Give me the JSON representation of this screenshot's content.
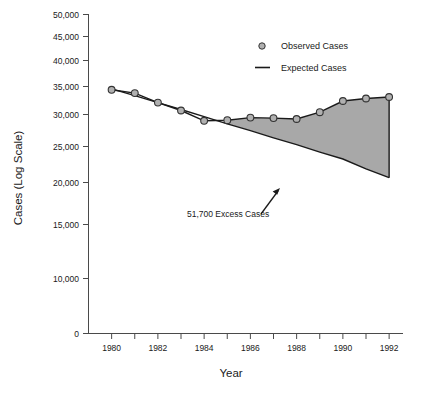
{
  "chart_data": {
    "type": "line",
    "title": "",
    "xlabel": "Year",
    "ylabel": "Cases (Log Scale)",
    "yscale": "log",
    "grid": false,
    "legend_position": "top-center-right",
    "xlim": [
      1979,
      1992.6
    ],
    "ylim": [
      8500,
      50000
    ],
    "x": [
      1980,
      1981,
      1982,
      1983,
      1984,
      1985,
      1986,
      1987,
      1988,
      1989,
      1990,
      1991,
      1992
    ],
    "xticks": [
      1980,
      1981,
      1982,
      1983,
      1984,
      1985,
      1986,
      1987,
      1988,
      1989,
      1990,
      1991,
      1992
    ],
    "xtick_labels": [
      "1980",
      "",
      "1982",
      "",
      "1984",
      "",
      "1986",
      "",
      "1988",
      "",
      "1990",
      "",
      "1992"
    ],
    "yticks": [
      0,
      10000,
      15000,
      20000,
      25000,
      30000,
      35000,
      40000,
      45000,
      50000
    ],
    "ytick_labels": [
      "0",
      "10,000",
      "15,000",
      "20,000",
      "25,000",
      "30,000",
      "35,000",
      "40,000",
      "45,000",
      "50,000"
    ],
    "series": [
      {
        "name": "Observed Cases",
        "marker": "circle",
        "values": [
          28000,
          27300,
          25400,
          23900,
          22100,
          22200,
          22650,
          22550,
          22400,
          23600,
          25700,
          26200,
          26500
        ]
      },
      {
        "name": "Expected Cases",
        "marker": "line",
        "values": [
          28200,
          26800,
          25400,
          24100,
          22800,
          21600,
          20500,
          19400,
          18400,
          17400,
          16500,
          15300,
          14300
        ]
      }
    ],
    "shaded_region": {
      "label": "51,700 Excess Cases",
      "x_start": 1985,
      "x_end": 1992,
      "fill_color": "#a8a8a8"
    },
    "annotations": [
      {
        "text": "51,700 Excess Cases",
        "arrow": "up-right-arrow"
      }
    ]
  },
  "legend": {
    "items": [
      {
        "label": "Observed Cases",
        "symbol": "circle-marker"
      },
      {
        "label": "Expected Cases",
        "symbol": "line-marker"
      }
    ]
  },
  "colors": {
    "ink": "#1a1a1a",
    "axis": "#4a4a4a",
    "fill": "#a8a8a8",
    "marker_fill": "#b0b0b0",
    "marker_edge": "#333333",
    "background": "#ffffff"
  }
}
